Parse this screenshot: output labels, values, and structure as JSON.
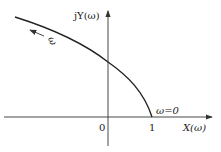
{
  "diagram": {
    "type": "nyquist-plot",
    "y_axis_label": "jY(ω)",
    "x_axis_label": "X(ω)",
    "origin_label": "0",
    "tick_one_label": "1",
    "start_point_label": "ω=0",
    "direction_label": "ω",
    "colors": {
      "curve": "#222222",
      "axis": "#333333"
    }
  }
}
